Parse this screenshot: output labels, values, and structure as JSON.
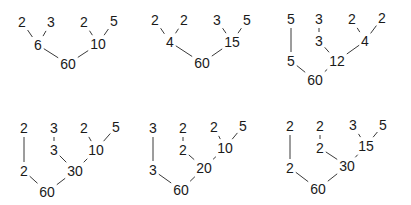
{
  "diagram": {
    "type": "factor-trees",
    "root_value": "60",
    "colors": {
      "ink": "#1a1a1a",
      "edge": "#3a3a3a",
      "background": "#ffffff"
    },
    "trees": [
      {
        "id": "tree-1",
        "nodes": [
          {
            "id": "a",
            "label": "2",
            "x": 22,
            "y": 22
          },
          {
            "id": "b",
            "label": "3",
            "x": 51,
            "y": 22
          },
          {
            "id": "c",
            "label": "6",
            "x": 38,
            "y": 45
          },
          {
            "id": "d",
            "label": "2",
            "x": 84,
            "y": 22
          },
          {
            "id": "e",
            "label": "5",
            "x": 114,
            "y": 21
          },
          {
            "id": "f",
            "label": "10",
            "x": 98,
            "y": 44
          },
          {
            "id": "g",
            "label": "60",
            "x": 68,
            "y": 64
          }
        ],
        "edges": [
          [
            "a",
            "c"
          ],
          [
            "b",
            "c"
          ],
          [
            "d",
            "f"
          ],
          [
            "e",
            "f"
          ],
          [
            "c",
            "g"
          ],
          [
            "f",
            "g"
          ]
        ]
      },
      {
        "id": "tree-2",
        "nodes": [
          {
            "id": "a",
            "label": "2",
            "x": 155,
            "y": 20
          },
          {
            "id": "b",
            "label": "2",
            "x": 184,
            "y": 20
          },
          {
            "id": "c",
            "label": "4",
            "x": 170,
            "y": 42
          },
          {
            "id": "d",
            "label": "3",
            "x": 217,
            "y": 20
          },
          {
            "id": "e",
            "label": "5",
            "x": 247,
            "y": 20
          },
          {
            "id": "f",
            "label": "15",
            "x": 232,
            "y": 42
          },
          {
            "id": "g",
            "label": "60",
            "x": 202,
            "y": 63
          }
        ],
        "edges": [
          [
            "a",
            "c"
          ],
          [
            "b",
            "c"
          ],
          [
            "d",
            "f"
          ],
          [
            "e",
            "f"
          ],
          [
            "c",
            "g"
          ],
          [
            "f",
            "g"
          ]
        ]
      },
      {
        "id": "tree-3",
        "nodes": [
          {
            "id": "a",
            "label": "5",
            "x": 291,
            "y": 19
          },
          {
            "id": "b",
            "label": "5",
            "x": 291,
            "y": 61
          },
          {
            "id": "c",
            "label": "3",
            "x": 319,
            "y": 19
          },
          {
            "id": "d",
            "label": "3",
            "x": 319,
            "y": 41
          },
          {
            "id": "e",
            "label": "2",
            "x": 352,
            "y": 19
          },
          {
            "id": "f",
            "label": "2",
            "x": 382,
            "y": 18
          },
          {
            "id": "g",
            "label": "4",
            "x": 365,
            "y": 41
          },
          {
            "id": "h",
            "label": "12",
            "x": 337,
            "y": 61
          },
          {
            "id": "i",
            "label": "60",
            "x": 315,
            "y": 80
          }
        ],
        "edges": [
          [
            "a",
            "b"
          ],
          [
            "c",
            "d"
          ],
          [
            "e",
            "g"
          ],
          [
            "f",
            "g"
          ],
          [
            "d",
            "h"
          ],
          [
            "g",
            "h"
          ],
          [
            "b",
            "i"
          ],
          [
            "h",
            "i"
          ]
        ]
      },
      {
        "id": "tree-4",
        "nodes": [
          {
            "id": "a",
            "label": "2",
            "x": 24,
            "y": 128
          },
          {
            "id": "b",
            "label": "2",
            "x": 24,
            "y": 171
          },
          {
            "id": "c",
            "label": "3",
            "x": 54,
            "y": 128
          },
          {
            "id": "d",
            "label": "3",
            "x": 54,
            "y": 150
          },
          {
            "id": "e",
            "label": "2",
            "x": 84,
            "y": 128
          },
          {
            "id": "f",
            "label": "5",
            "x": 116,
            "y": 127
          },
          {
            "id": "g",
            "label": "10",
            "x": 96,
            "y": 150
          },
          {
            "id": "h",
            "label": "30",
            "x": 75,
            "y": 171
          },
          {
            "id": "i",
            "label": "60",
            "x": 47,
            "y": 192
          }
        ],
        "edges": [
          [
            "a",
            "b"
          ],
          [
            "c",
            "d"
          ],
          [
            "e",
            "g"
          ],
          [
            "f",
            "g"
          ],
          [
            "d",
            "h"
          ],
          [
            "g",
            "h"
          ],
          [
            "b",
            "i"
          ],
          [
            "h",
            "i"
          ]
        ]
      },
      {
        "id": "tree-5",
        "nodes": [
          {
            "id": "a",
            "label": "3",
            "x": 153,
            "y": 128
          },
          {
            "id": "b",
            "label": "3",
            "x": 153,
            "y": 170
          },
          {
            "id": "c",
            "label": "2",
            "x": 183,
            "y": 128
          },
          {
            "id": "d",
            "label": "2",
            "x": 183,
            "y": 150
          },
          {
            "id": "e",
            "label": "2",
            "x": 214,
            "y": 127
          },
          {
            "id": "f",
            "label": "5",
            "x": 243,
            "y": 126
          },
          {
            "id": "g",
            "label": "10",
            "x": 225,
            "y": 148
          },
          {
            "id": "h",
            "label": "20",
            "x": 204,
            "y": 168
          },
          {
            "id": "i",
            "label": "60",
            "x": 181,
            "y": 190
          }
        ],
        "edges": [
          [
            "a",
            "b"
          ],
          [
            "c",
            "d"
          ],
          [
            "e",
            "g"
          ],
          [
            "f",
            "g"
          ],
          [
            "d",
            "h"
          ],
          [
            "g",
            "h"
          ],
          [
            "b",
            "i"
          ],
          [
            "h",
            "i"
          ]
        ]
      },
      {
        "id": "tree-6",
        "nodes": [
          {
            "id": "a",
            "label": "2",
            "x": 290,
            "y": 126
          },
          {
            "id": "b",
            "label": "2",
            "x": 290,
            "y": 168
          },
          {
            "id": "c",
            "label": "2",
            "x": 320,
            "y": 126
          },
          {
            "id": "d",
            "label": "2",
            "x": 320,
            "y": 148
          },
          {
            "id": "e",
            "label": "3",
            "x": 353,
            "y": 125
          },
          {
            "id": "f",
            "label": "5",
            "x": 383,
            "y": 125
          },
          {
            "id": "g",
            "label": "15",
            "x": 366,
            "y": 146
          },
          {
            "id": "h",
            "label": "30",
            "x": 347,
            "y": 166
          },
          {
            "id": "i",
            "label": "60",
            "x": 318,
            "y": 189
          }
        ],
        "edges": [
          [
            "a",
            "b"
          ],
          [
            "c",
            "d"
          ],
          [
            "e",
            "g"
          ],
          [
            "f",
            "g"
          ],
          [
            "d",
            "h"
          ],
          [
            "g",
            "h"
          ],
          [
            "b",
            "i"
          ],
          [
            "h",
            "i"
          ]
        ]
      }
    ]
  }
}
